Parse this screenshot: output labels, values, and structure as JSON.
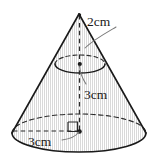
{
  "figure": {
    "kind": "cone-with-dimensions",
    "background_color": "#ffffff",
    "outline_color": "#1a1a1a",
    "hatch_color": "#c9c9c9",
    "dashed_color": "#2b2b2b",
    "leader_color": "#6e6e6e",
    "labels": {
      "top": {
        "value": "2",
        "unit": "cm",
        "text": "2cm"
      },
      "middle": {
        "value": "3",
        "unit": "cm",
        "text": "3cm"
      },
      "bottom": {
        "value": "3",
        "unit": "cm",
        "text": "3cm"
      }
    },
    "geometry": {
      "apex": {
        "x": 79,
        "y": 14
      },
      "base_center": {
        "x": 79,
        "y": 133
      },
      "base_rx": 67,
      "base_ry": 19,
      "mid_ellipse_center": {
        "x": 80,
        "y": 64
      },
      "mid_rx": 25,
      "mid_ry": 9,
      "right_angle_marker": {
        "x": 68,
        "y": 121,
        "size": 9
      }
    },
    "markers": {
      "center_dot_base": "filled-dot",
      "center_dot_mid": "filled-dot",
      "right_angle": "square"
    }
  }
}
